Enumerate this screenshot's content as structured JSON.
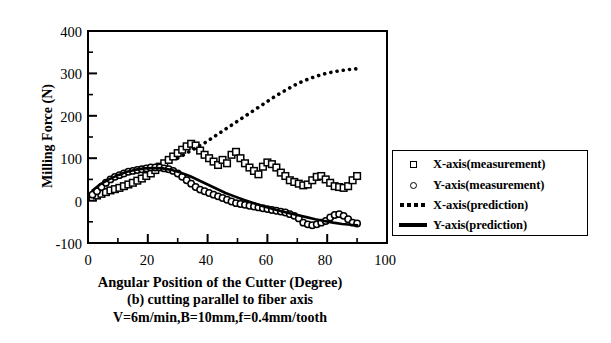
{
  "chart_data": {
    "type": "scatter",
    "title": "",
    "xlabel": "Angular  Position of the Cutter (Degree)",
    "ylabel": "Milling Force (N)",
    "xlim": [
      0,
      100
    ],
    "ylim": [
      -100,
      400
    ],
    "xticks": [
      0,
      20,
      40,
      60,
      80,
      100
    ],
    "yticks": [
      -100,
      0,
      100,
      200,
      300,
      400
    ],
    "xtick_labels": [
      "0",
      "20",
      "40",
      "60",
      "80",
      "100"
    ],
    "ytick_labels": [
      "-100",
      "0",
      "100",
      "200",
      "300",
      "400"
    ],
    "x_minor_tick_step": 10,
    "y_minor_tick_step": 50,
    "grid": false,
    "legend_position": "right-outside",
    "legend_entries": [
      {
        "label": "X-axis(measurement)",
        "marker": "open-square"
      },
      {
        "label": "Y-axis(measurement)",
        "marker": "open-circle"
      },
      {
        "label": "X-axis(prediction)",
        "marker": "dotted-line"
      },
      {
        "label": "Y-axis(prediction)",
        "marker": "solid-line"
      }
    ],
    "series": [
      {
        "name": "X-axis(measurement)",
        "marker": "open-square",
        "x": [
          1.5,
          3,
          4.5,
          6,
          7.5,
          9,
          10.5,
          12,
          13.5,
          15,
          16.5,
          18,
          19.5,
          21,
          22.5,
          24,
          25.5,
          27,
          28.5,
          30,
          31.5,
          33,
          34.5,
          36,
          37.5,
          39,
          40.5,
          42,
          43.5,
          45,
          46.5,
          48,
          49.5,
          51,
          52.5,
          54,
          55.5,
          57,
          58.5,
          60,
          61.5,
          63,
          64.5,
          66,
          67.5,
          69,
          70.5,
          72,
          73.5,
          75,
          76.5,
          78,
          79.5,
          81,
          82.5,
          84,
          85.5,
          87,
          88.5,
          90
        ],
        "y": [
          8,
          12,
          16,
          20,
          24,
          27,
          30,
          34,
          38,
          42,
          47,
          52,
          58,
          64,
          72,
          80,
          88,
          96,
          104,
          112,
          120,
          128,
          134,
          130,
          118,
          108,
          100,
          92,
          84,
          96,
          88,
          108,
          115,
          100,
          88,
          78,
          70,
          62,
          80,
          90,
          86,
          78,
          66,
          58,
          48,
          44,
          40,
          36,
          38,
          48,
          56,
          58,
          50,
          42,
          34,
          32,
          30,
          34,
          48,
          58
        ]
      },
      {
        "name": "Y-axis(measurement)",
        "marker": "open-circle",
        "x": [
          1.5,
          3,
          4.5,
          6,
          7.5,
          9,
          10.5,
          12,
          13.5,
          15,
          16.5,
          18,
          19.5,
          21,
          22.5,
          24,
          25.5,
          27,
          28.5,
          30,
          31.5,
          33,
          34.5,
          36,
          37.5,
          39,
          40.5,
          42,
          43.5,
          45,
          46.5,
          48,
          49.5,
          51,
          52.5,
          54,
          55.5,
          57,
          58.5,
          60,
          61.5,
          63,
          64.5,
          66,
          67.5,
          69,
          70.5,
          72,
          73.5,
          75,
          76.5,
          78,
          79.5,
          81,
          82.5,
          84,
          85.5,
          87,
          88.5,
          90
        ],
        "y": [
          14,
          22,
          32,
          42,
          50,
          56,
          60,
          64,
          68,
          70,
          72,
          74,
          76,
          78,
          78,
          78,
          76,
          74,
          70,
          64,
          56,
          48,
          40,
          32,
          26,
          22,
          18,
          14,
          10,
          6,
          2,
          -2,
          -6,
          -8,
          -10,
          -12,
          -14,
          -16,
          -18,
          -20,
          -22,
          -24,
          -26,
          -28,
          -32,
          -36,
          -42,
          -52,
          -56,
          -58,
          -56,
          -52,
          -48,
          -40,
          -34,
          -32,
          -36,
          -44,
          -52,
          -54
        ]
      },
      {
        "name": "X-axis(prediction)",
        "marker": "dotted-line",
        "x": [
          30,
          33,
          36,
          39,
          42,
          45,
          48,
          51,
          54,
          57,
          60,
          63,
          66,
          69,
          72,
          75,
          78,
          81,
          84,
          87,
          90
        ],
        "y": [
          100,
          112,
          124,
          136,
          150,
          164,
          178,
          192,
          206,
          220,
          234,
          248,
          260,
          272,
          282,
          290,
          297,
          302,
          306,
          309,
          311
        ]
      },
      {
        "name": "Y-axis(prediction)",
        "marker": "solid-line",
        "x": [
          1.5,
          4,
          7,
          10,
          13,
          16,
          19,
          22,
          25,
          28,
          31,
          34,
          37,
          40,
          43,
          46,
          49,
          52,
          55,
          58,
          61,
          64,
          67,
          70,
          73,
          76,
          79,
          82,
          85,
          88,
          90
        ],
        "y": [
          24,
          38,
          50,
          60,
          68,
          73,
          76,
          77,
          76,
          72,
          66,
          58,
          48,
          38,
          28,
          18,
          10,
          2,
          -5,
          -12,
          -18,
          -24,
          -29,
          -34,
          -39,
          -44,
          -48,
          -52,
          -55,
          -57,
          -58
        ]
      }
    ]
  },
  "caption": {
    "axis_title": "Angular  Position of the Cutter (Degree)",
    "part_label": "(b)  cutting parallel to fiber axis",
    "conditions": "V=6m/min,B=10mm,f=0.4mm/tooth"
  }
}
